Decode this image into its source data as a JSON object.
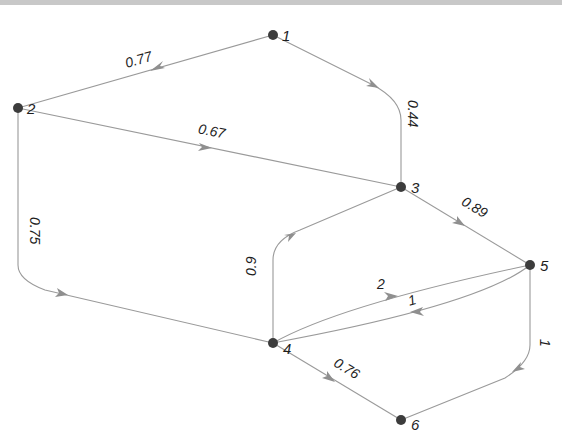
{
  "diagram": {
    "type": "directed-weighted-graph",
    "colors": {
      "background": "#ffffff",
      "edge": "#9a9a9a",
      "node": "#3c3c3c",
      "text": "#1e1e1e"
    },
    "nodes": [
      {
        "id": "1",
        "label": "1",
        "x": 273,
        "y": 35
      },
      {
        "id": "2",
        "label": "2",
        "x": 18,
        "y": 108
      },
      {
        "id": "3",
        "label": "3",
        "x": 401,
        "y": 187
      },
      {
        "id": "4",
        "label": "4",
        "x": 273,
        "y": 343
      },
      {
        "id": "5",
        "label": "5",
        "x": 530,
        "y": 265
      },
      {
        "id": "6",
        "label": "6",
        "x": 401,
        "y": 420
      }
    ],
    "edges": [
      {
        "from": "1",
        "to": "2",
        "weight": "0.77"
      },
      {
        "from": "1",
        "to": "3",
        "weight": "0.44"
      },
      {
        "from": "2",
        "to": "3",
        "weight": "0.67"
      },
      {
        "from": "2",
        "to": "4",
        "weight": "0.75"
      },
      {
        "from": "3",
        "to": "5",
        "weight": "0.89"
      },
      {
        "from": "4",
        "to": "3",
        "weight": "0.9"
      },
      {
        "from": "4",
        "to": "5",
        "weight": "2"
      },
      {
        "from": "5",
        "to": "4",
        "weight": "1"
      },
      {
        "from": "4",
        "to": "6",
        "weight": "0.76"
      },
      {
        "from": "5",
        "to": "6",
        "weight": "1"
      }
    ]
  }
}
